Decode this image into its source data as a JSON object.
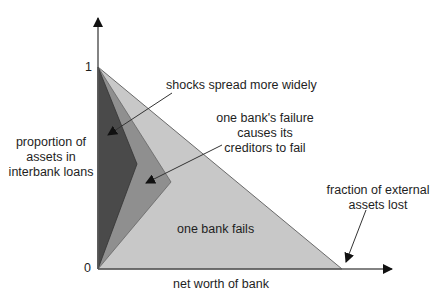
{
  "diagram": {
    "axes": {
      "x_label": "net worth of bank",
      "y_label": "proportion of\nassets in\ninterbank loans",
      "y_label_lines": [
        "proportion of",
        "assets in",
        "interbank loans"
      ],
      "y_tick_top": "1",
      "origin": "0"
    },
    "regions": [
      {
        "id": "one-bank-fails",
        "label": "one bank fails",
        "color": "#c8c8c8"
      },
      {
        "id": "creditors-fail",
        "label_lines": [
          "one bank's failure",
          "causes its",
          "creditors to fail"
        ],
        "color": "#8f8f8f"
      },
      {
        "id": "shocks-spread",
        "label": "shocks spread more widely",
        "color": "#4a4a4a"
      }
    ],
    "annotations": {
      "external_assets_lines": [
        "fraction of external",
        "assets lost"
      ]
    },
    "colors": {
      "axis": "#5a5a5a",
      "light": "#c8c8c8",
      "medium": "#8f8f8f",
      "dark": "#4a4a4a"
    }
  }
}
